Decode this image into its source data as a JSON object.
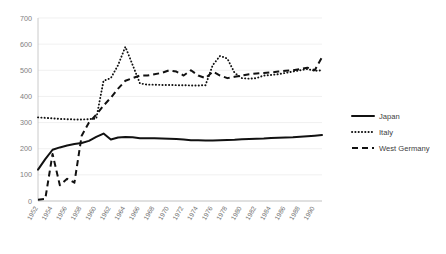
{
  "chart_data": {
    "type": "line",
    "title": "",
    "xlabel": "",
    "ylabel": "",
    "ylim": [
      0,
      700
    ],
    "yticks": [
      0,
      100,
      200,
      300,
      400,
      500,
      600,
      700
    ],
    "grid": true,
    "legend_position": "right",
    "x": [
      1952,
      1953,
      1954,
      1955,
      1956,
      1957,
      1958,
      1959,
      1960,
      1961,
      1962,
      1963,
      1964,
      1965,
      1966,
      1967,
      1968,
      1969,
      1970,
      1971,
      1972,
      1973,
      1974,
      1975,
      1976,
      1977,
      1978,
      1979,
      1980,
      1981,
      1982,
      1983,
      1984,
      1985,
      1986,
      1987,
      1988,
      1989,
      1990,
      1991
    ],
    "xtick_labels": [
      "1952",
      "1954",
      "1956",
      "1958",
      "1960",
      "1962",
      "1964",
      "1966",
      "1968",
      "1970",
      "1972",
      "1974",
      "1976",
      "1978",
      "1980",
      "1982",
      "1984",
      "1986",
      "1988",
      "1990"
    ],
    "series": [
      {
        "name": "Japan",
        "style": "solid",
        "color": "#111111",
        "values": [
          120,
          160,
          196,
          205,
          212,
          218,
          222,
          230,
          245,
          258,
          235,
          243,
          245,
          244,
          240,
          240,
          240,
          239,
          238,
          237,
          235,
          232,
          232,
          231,
          231,
          232,
          233,
          234,
          236,
          237,
          238,
          239,
          241,
          242,
          243,
          244,
          246,
          248,
          250,
          252
        ]
      },
      {
        "name": "Italy",
        "style": "dotted",
        "color": "#111111",
        "values": [
          320,
          318,
          316,
          314,
          313,
          312,
          312,
          313,
          315,
          460,
          470,
          520,
          590,
          520,
          450,
          445,
          445,
          444,
          444,
          443,
          443,
          442,
          442,
          443,
          520,
          555,
          545,
          490,
          470,
          468,
          470,
          480,
          482,
          485,
          490,
          495,
          500,
          505,
          498,
          500
        ]
      },
      {
        "name": "West Germany",
        "style": "dashed",
        "color": "#111111",
        "values": [
          5,
          8,
          180,
          60,
          85,
          70,
          250,
          300,
          330,
          365,
          395,
          430,
          460,
          470,
          480,
          480,
          485,
          490,
          500,
          495,
          480,
          500,
          480,
          470,
          495,
          480,
          470,
          475,
          480,
          485,
          488,
          490,
          492,
          495,
          498,
          500,
          505,
          510,
          500,
          550
        ]
      }
    ]
  },
  "legend": {
    "items": [
      {
        "label": "Japan",
        "style": "solid"
      },
      {
        "label": "Italy",
        "style": "dotted"
      },
      {
        "label": "West Germany",
        "style": "dashed"
      }
    ]
  },
  "colors": {
    "series": "#111111",
    "grid": "#e9e9e9",
    "axis": "#bdbdbd",
    "tick_label": "#808080",
    "background": "#ffffff"
  }
}
